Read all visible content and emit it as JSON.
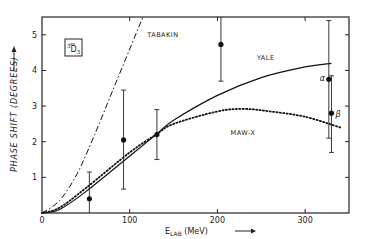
{
  "chart_data": {
    "type": "line",
    "title": "",
    "panel_label": {
      "main": "D",
      "pre_superscript": "3",
      "subscript": "3",
      "bar": true
    },
    "xlabel": {
      "main": "E",
      "sub": "LAB",
      "unit": "(MeV)",
      "arrow": "→"
    },
    "ylabel": "PHASE SHIFT (DEGREES)",
    "ylabel_arrow": "→",
    "xlim": [
      0,
      350
    ],
    "ylim": [
      0,
      5.5
    ],
    "xticks": [
      0,
      100,
      200,
      300
    ],
    "xtick_labels": [
      "0",
      "100",
      "200",
      "300"
    ],
    "yticks": [
      1,
      2,
      3,
      4,
      5
    ],
    "ytick_labels": [
      "1",
      "2",
      "3",
      "4",
      "5"
    ],
    "grid": false,
    "series": [
      {
        "name": "TABAKIN",
        "style": "dash-dot",
        "x": [
          0,
          20,
          40,
          60,
          80,
          100,
          115
        ],
        "y": [
          0,
          0.35,
          1.1,
          2.2,
          3.4,
          4.6,
          5.5
        ]
      },
      {
        "name": "YALE",
        "style": "solid",
        "x": [
          0,
          20,
          50,
          100,
          130,
          150,
          200,
          250,
          300,
          330
        ],
        "y": [
          0,
          0.1,
          0.6,
          1.6,
          2.2,
          2.6,
          3.3,
          3.8,
          4.1,
          4.2
        ]
      },
      {
        "name": "MAW-X",
        "style": "dotted",
        "x": [
          0,
          20,
          50,
          100,
          130,
          150,
          200,
          230,
          260,
          300,
          340
        ],
        "y": [
          0,
          0.15,
          0.7,
          1.7,
          2.2,
          2.5,
          2.85,
          2.92,
          2.85,
          2.7,
          2.4
        ]
      }
    ],
    "curve_labels": [
      {
        "text": "TABAKIN",
        "x": 120,
        "y": 4.95
      },
      {
        "text": "YALE",
        "x": 245,
        "y": 4.3
      },
      {
        "text": "MAW-X",
        "x": 215,
        "y": 2.2
      }
    ],
    "points": [
      {
        "x": 54,
        "y": 0.4,
        "err_low": 0.0,
        "err_high": 1.15
      },
      {
        "x": 93,
        "y": 2.05,
        "err_low": 0.67,
        "err_high": 3.45
      },
      {
        "x": 131,
        "y": 2.2,
        "err_low": 1.5,
        "err_high": 2.9
      },
      {
        "x": 204,
        "y": 4.73,
        "err_low": 3.7,
        "err_high": 5.5
      },
      {
        "x": 327,
        "y": 3.75,
        "err_low": 2.1,
        "err_high": 5.4,
        "label": "α"
      },
      {
        "x": 330,
        "y": 2.8,
        "err_low": 1.7,
        "err_high": 3.85,
        "label": "β"
      }
    ]
  }
}
